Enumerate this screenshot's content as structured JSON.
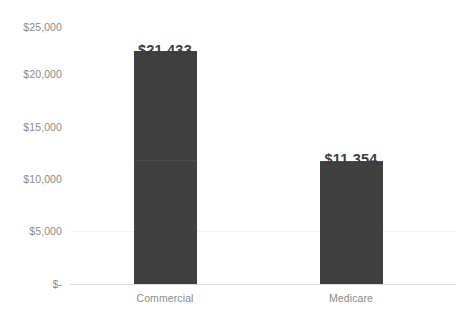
{
  "chart_data": {
    "type": "bar",
    "title": "",
    "xlabel": "",
    "ylabel": "",
    "categories": [
      "Commercial",
      "Medicare"
    ],
    "values": [
      21433,
      11354
    ],
    "value_labels": [
      "$21,433",
      "$11,354"
    ],
    "ylim": [
      0,
      25000
    ],
    "ytick_values": [
      25000,
      20000,
      15000,
      10000,
      5000,
      0
    ],
    "ytick_labels": [
      "$25,000",
      "$20,000",
      "$15,000",
      "$10,000",
      "$5,000",
      "$-"
    ],
    "grid": false,
    "legend": null,
    "legend_position": "none",
    "series": [
      {
        "name": "",
        "values": [
          21433,
          11354
        ]
      }
    ]
  },
  "style": {
    "bar_color": "#404040",
    "axis_line_color": "#d9d9d9",
    "tick_label_color": "#8a8a8a",
    "value_label_color": "#3d3d3d",
    "background_color": "#ffffff"
  },
  "axis": {
    "y_ticks": [
      {
        "label": "$25,000",
        "top": 21
      },
      {
        "label": "$20,000",
        "top": 68
      },
      {
        "label": "$15,000",
        "top": 121
      },
      {
        "label": "$10,000",
        "top": 173
      },
      {
        "label": "$5,000",
        "top": 225
      },
      {
        "label": "$-",
        "top": 278
      }
    ]
  }
}
